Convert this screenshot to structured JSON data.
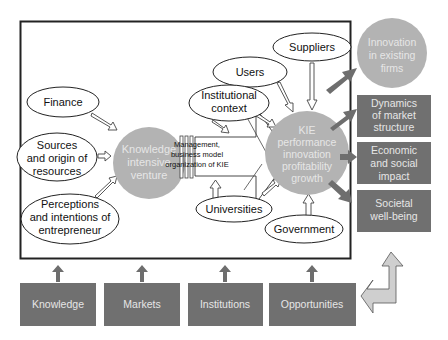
{
  "diagram": {
    "title": "",
    "frame_inputs": {
      "finance": "Finance",
      "sources": [
        "Sources",
        "and origin of",
        "resources"
      ],
      "perceptions": [
        "Perceptions",
        "and intentions of",
        "entrepreneur"
      ],
      "users": "Users",
      "suppliers": "Suppliers",
      "institutional": [
        "Institutional",
        "context"
      ],
      "universities": "Universities",
      "government": "Government"
    },
    "kiv_circle": [
      "Knowledge",
      "intensive",
      "venture"
    ],
    "management_box": [
      "Management,",
      "business model",
      "organization of KIE"
    ],
    "kie_circle": [
      "KIE",
      "performance",
      "innovation",
      "profitability",
      "growth"
    ],
    "outcomes": {
      "innovation": [
        "Innovation",
        "in existing",
        "firms"
      ],
      "dynamics": [
        "Dynamics",
        "of market",
        "structure"
      ],
      "economic": [
        "Economic",
        "and social",
        "impact"
      ],
      "societal": [
        "Societal",
        "well-being"
      ]
    },
    "bottom_boxes": [
      "Knowledge",
      "Markets",
      "Institutions",
      "Opportunities"
    ],
    "colors": {
      "dark_box": "#707070",
      "circle": "#b3b3b3",
      "frame": "#222222",
      "feedback_arrow": "#cfcfcf"
    }
  }
}
